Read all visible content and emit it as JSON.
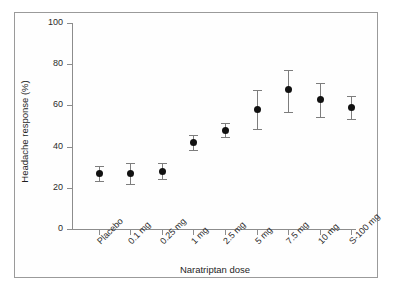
{
  "chart_data": {
    "type": "scatter",
    "title": "",
    "xlabel": "Naratriptan dose",
    "ylabel": "Headache response (%)",
    "categories": [
      "Placebo",
      "0.1 mg",
      "0.25 mg",
      "1 mg",
      "2.5 mg",
      "5 mg",
      "7.5 mg",
      "10 mg",
      "S-100 mg"
    ],
    "values": [
      27,
      27,
      28,
      42,
      48,
      58,
      67.5,
      63,
      59
    ],
    "error_low": [
      23.5,
      22,
      24.5,
      38.5,
      44.5,
      48.5,
      57,
      54.5,
      53.5
    ],
    "error_high": [
      30.5,
      32,
      32,
      45.5,
      51.5,
      67.5,
      77,
      71,
      64.5
    ],
    "ylim": [
      0,
      100
    ],
    "y_ticks": [
      0,
      20,
      40,
      60,
      80,
      100
    ],
    "y_tick_labels": [
      "0",
      "20",
      "40",
      "60",
      "80",
      "100"
    ],
    "grid": false,
    "legend": "none",
    "marker_color": "#111111",
    "errorbar_color": "#7d7d7d",
    "axis_color": "#8c8c8c",
    "background": "#ffffff"
  }
}
